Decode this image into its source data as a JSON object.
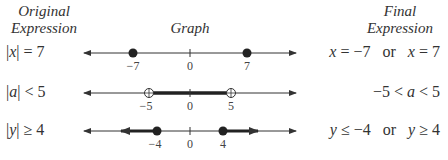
{
  "headers": {
    "original_line1": "Original",
    "original_line2": "Expression",
    "graph": "Graph",
    "final_line1": "Final",
    "final_line2": "Expression"
  },
  "rows": [
    {
      "original": {
        "bar_var": "x",
        "op": "=",
        "value": "7"
      },
      "final": {
        "a_var": "x",
        "a_op": "=",
        "a_val": "−7",
        "connector": "or",
        "b_var": "x",
        "b_op": "=",
        "b_val": "7"
      },
      "graph": {
        "type": "points",
        "points": [
          -7,
          7
        ],
        "closed": true,
        "labels": [
          "−7",
          "0",
          "7"
        ]
      }
    },
    {
      "original": {
        "bar_var": "a",
        "op": "<",
        "value": "5"
      },
      "final": {
        "left": "−5",
        "op1": "<",
        "var": "a",
        "op2": "<",
        "right": "5"
      },
      "graph": {
        "type": "interval",
        "from": -5,
        "to": 5,
        "closed": false,
        "labels": [
          "−5",
          "0",
          "5"
        ]
      }
    },
    {
      "original": {
        "bar_var": "y",
        "op": "≥",
        "value": "4"
      },
      "final": {
        "a_var": "y",
        "a_op": "≤",
        "a_val": "−4",
        "connector": "or",
        "b_var": "y",
        "b_op": "≥",
        "b_val": "4"
      },
      "graph": {
        "type": "rays",
        "left_from": -4,
        "right_from": 4,
        "closed": true,
        "labels": [
          "−4",
          "0",
          "4"
        ]
      }
    }
  ]
}
